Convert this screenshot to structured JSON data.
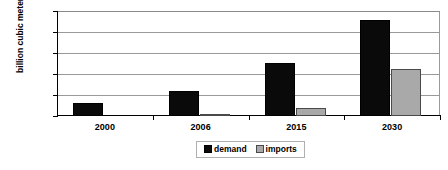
{
  "chart_data": {
    "type": "bar",
    "title": "",
    "xlabel": "",
    "ylabel": "billion cubic meters",
    "categories": [
      "2000",
      "2006",
      "2015",
      "2030"
    ],
    "series": [
      {
        "name": "demand",
        "color": "#0a0a0a",
        "values": [
          30,
          60,
          126,
          228
        ]
      },
      {
        "name": "imports",
        "color": "#a9a9a9",
        "values": [
          0,
          3,
          20,
          112
        ]
      }
    ],
    "ylim": [
      0,
      250
    ],
    "ytick_values": [
      0,
      50,
      100,
      150,
      200,
      250
    ],
    "ytick_labels": [
      "0",
      "50",
      "100",
      "150",
      "200",
      "250"
    ],
    "grid": true,
    "legend_position": "bottom-center",
    "legend_entries": [
      "demand",
      "imports"
    ]
  }
}
